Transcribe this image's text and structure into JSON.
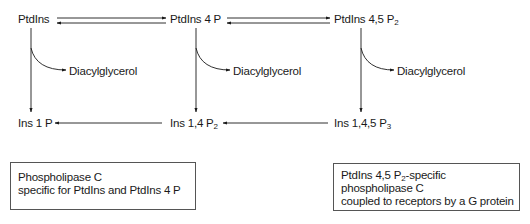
{
  "diagram": {
    "nodes": {
      "ptdins": {
        "text": "PtdIns",
        "sub": ""
      },
      "ptdins4p": {
        "text": "PtdIns 4 P",
        "sub": ""
      },
      "ptdins45p2": {
        "text": "PtdIns 4,5 P",
        "sub": "2"
      },
      "ins1p": {
        "text": "Ins 1 P",
        "sub": ""
      },
      "ins14p2": {
        "text": "Ins 1,4 P",
        "sub": "2"
      },
      "ins145p3": {
        "text": "Ins 1,4,5 P",
        "sub": "3"
      },
      "dag1": {
        "text": "Diacylglycerol"
      },
      "dag2": {
        "text": "Diacylglycerol"
      },
      "dag3": {
        "text": "Diacylglycerol"
      }
    },
    "edges": [
      {
        "from": "PtdIns",
        "to": "PtdIns 4 P",
        "type": "reversible"
      },
      {
        "from": "PtdIns 4 P",
        "to": "PtdIns 4,5 P2",
        "type": "reversible"
      },
      {
        "from": "PtdIns",
        "to": "Ins 1 P",
        "branch": "Diacylglycerol"
      },
      {
        "from": "PtdIns 4 P",
        "to": "Ins 1,4 P2",
        "branch": "Diacylglycerol"
      },
      {
        "from": "PtdIns 4,5 P2",
        "to": "Ins 1,4,5 P3",
        "branch": "Diacylglycerol"
      },
      {
        "from": "Ins 1,4,5 P3",
        "to": "Ins 1,4 P2"
      },
      {
        "from": "Ins 1,4 P2",
        "to": "Ins 1 P"
      }
    ],
    "boxes": {
      "left": {
        "line1": "Phospholipase C",
        "line2": "specific for PtdIns and PtdIns 4 P"
      },
      "right": {
        "line1_pre": "PtdIns 4,5 P",
        "line1_sub": "2",
        "line1_post": "-specific",
        "line2": "phospholipase C",
        "line3": "coupled to receptors by a G protein"
      }
    }
  }
}
